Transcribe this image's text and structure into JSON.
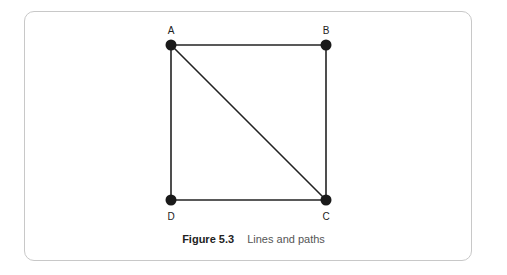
{
  "diagram": {
    "nodes": [
      {
        "id": "A",
        "label": "A",
        "x": 171,
        "y": 45,
        "label_pos": "above"
      },
      {
        "id": "B",
        "label": "B",
        "x": 326,
        "y": 45,
        "label_pos": "above"
      },
      {
        "id": "C",
        "label": "C",
        "x": 326,
        "y": 200,
        "label_pos": "below"
      },
      {
        "id": "D",
        "label": "D",
        "x": 171,
        "y": 200,
        "label_pos": "below"
      }
    ],
    "edges": [
      {
        "from": "A",
        "to": "B"
      },
      {
        "from": "B",
        "to": "C"
      },
      {
        "from": "C",
        "to": "D"
      },
      {
        "from": "D",
        "to": "A"
      },
      {
        "from": "A",
        "to": "C"
      }
    ],
    "colors": {
      "node": "#1a1a1a",
      "edge": "#222222",
      "frame": "#c8c8c8"
    }
  },
  "caption": {
    "figure_label": "Figure 5.3",
    "text": "Lines and paths"
  }
}
